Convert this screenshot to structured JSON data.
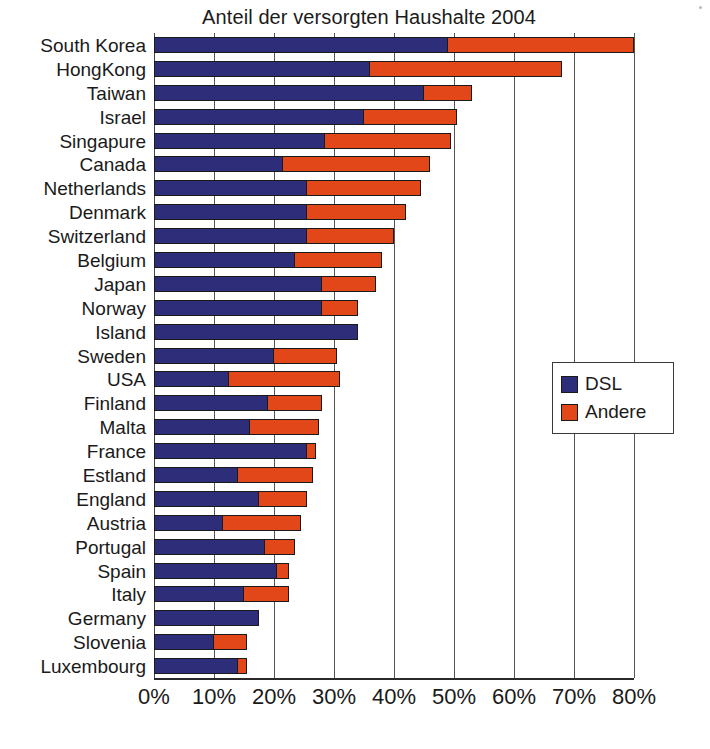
{
  "chart_data": {
    "type": "bar",
    "orientation": "horizontal",
    "stacked": true,
    "title": "Anteil der versorgten Haushalte 2004",
    "xlabel": "",
    "ylabel": "",
    "xlim": [
      0,
      80
    ],
    "xtick_labels": [
      "0%",
      "10%",
      "20%",
      "30%",
      "40%",
      "50%",
      "60%",
      "70%",
      "80%"
    ],
    "xtick_values": [
      0,
      10,
      20,
      30,
      40,
      50,
      60,
      70,
      80
    ],
    "grid": true,
    "legend_position": "middle-right",
    "categories": [
      "South Korea",
      "HongKong",
      "Taiwan",
      "Israel",
      "Singapure",
      "Canada",
      "Netherlands",
      "Denmark",
      "Switzerland",
      "Belgium",
      "Japan",
      "Norway",
      "Island",
      "Sweden",
      "USA",
      "Finland",
      "Malta",
      "France",
      "Estland",
      "England",
      "Austria",
      "Portugal",
      "Spain",
      "Italy",
      "Germany",
      "Slovenia",
      "Luxembourg"
    ],
    "series": [
      {
        "name": "DSL",
        "color": "#2d2d7a",
        "values": [
          49.0,
          36.0,
          45.0,
          35.0,
          28.5,
          21.5,
          25.5,
          25.5,
          25.5,
          23.5,
          28.0,
          28.0,
          34.0,
          20.0,
          12.5,
          19.0,
          16.0,
          25.5,
          14.0,
          17.5,
          11.5,
          18.5,
          20.5,
          15.0,
          17.5,
          10.0,
          14.0
        ]
      },
      {
        "name": "Andere",
        "color": "#e2471a",
        "values": [
          31.0,
          32.0,
          8.0,
          15.5,
          21.0,
          24.5,
          19.0,
          16.5,
          14.5,
          14.5,
          9.0,
          6.0,
          0.0,
          10.5,
          18.5,
          9.0,
          11.5,
          1.5,
          12.5,
          8.0,
          13.0,
          5.0,
          2.0,
          7.5,
          0.0,
          5.5,
          1.5
        ]
      }
    ],
    "totals": [
      80.0,
      68.0,
      53.0,
      50.5,
      49.5,
      46.0,
      44.5,
      42.0,
      40.0,
      38.0,
      37.0,
      34.0,
      34.0,
      30.5,
      31.0,
      28.0,
      27.5,
      27.0,
      26.5,
      25.5,
      24.5,
      23.5,
      22.5,
      22.5,
      17.5,
      15.5,
      15.5
    ]
  },
  "legend": {
    "items": [
      {
        "label": "DSL",
        "color": "#2d2d7a"
      },
      {
        "label": "Andere",
        "color": "#e2471a"
      }
    ]
  },
  "caption": {
    "sliver_text": ""
  }
}
